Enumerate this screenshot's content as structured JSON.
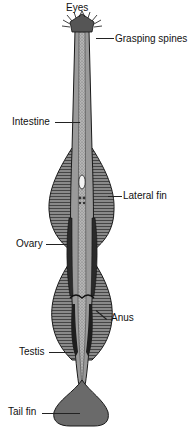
{
  "diagram": {
    "labels": {
      "eyes": "Eyes",
      "grasping_spines": "Grasping spines",
      "intestine": "Intestine",
      "lateral_fin": "Lateral fin",
      "ovary": "Ovary",
      "anus": "Anus",
      "testis": "Testis",
      "tail_fin": "Tail fin"
    },
    "colors": {
      "body_fill": "#9a9a9a",
      "fin_fill": "#6e6e6e",
      "outline": "#1a1a1a",
      "gut_fill": "#b8b8b8"
    }
  }
}
